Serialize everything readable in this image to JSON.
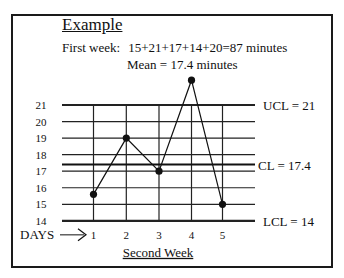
{
  "header": {
    "title": "Example",
    "first_week_label": "First week:",
    "first_week_sum": "15+21+17+14+20=87 minutes",
    "mean_text": "Mean = 17.4 minutes"
  },
  "labels": {
    "ucl": "UCL = 21",
    "cl": "CL = 17.4",
    "lcl": "LCL = 14",
    "days": "DAYS",
    "xlabel": "Second Week"
  },
  "chart_data": {
    "type": "line",
    "title": "Example",
    "subtitle": "First week: 15+21+17+14+20=87 minutes; Mean = 17.4 minutes",
    "xlabel": "Second Week",
    "xaxis_prefix": "DAYS",
    "ylabel": "",
    "categories": [
      "1",
      "2",
      "3",
      "4",
      "5"
    ],
    "series": [
      {
        "name": "Second Week",
        "values": [
          15.6,
          19,
          17,
          22.5,
          15
        ]
      }
    ],
    "yticks": [
      14,
      15,
      16,
      17,
      18,
      19,
      20,
      21
    ],
    "ylim": [
      14,
      21
    ],
    "control_lines": [
      {
        "name": "UCL",
        "value": 21,
        "label": "UCL = 21"
      },
      {
        "name": "CL",
        "value": 17.4,
        "label": "CL = 17.4"
      },
      {
        "name": "LCL",
        "value": 14,
        "label": "LCL = 14"
      }
    ],
    "grid": true,
    "legend": "none"
  }
}
